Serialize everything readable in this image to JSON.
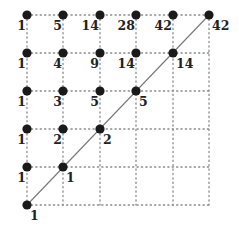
{
  "diagram": {
    "grid_size": 5,
    "colors": {
      "dot": "#1a1a1a",
      "grid": "#8a8a8a",
      "diagonal": "#777777",
      "label": "#222222"
    },
    "columns_px": [
      27,
      63,
      100,
      136,
      173,
      209
    ],
    "rows_px": [
      15,
      53,
      91,
      129,
      167,
      205
    ],
    "points": [
      {
        "col": 0,
        "row": 0,
        "label": "1",
        "side": "left"
      },
      {
        "col": 1,
        "row": 0,
        "label": "5",
        "side": "left"
      },
      {
        "col": 2,
        "row": 0,
        "label": "14",
        "side": "left"
      },
      {
        "col": 3,
        "row": 0,
        "label": "28",
        "side": "left"
      },
      {
        "col": 4,
        "row": 0,
        "label": "42",
        "side": "left"
      },
      {
        "col": 5,
        "row": 0,
        "label": "42",
        "side": "right"
      },
      {
        "col": 0,
        "row": 1,
        "label": "1",
        "side": "left"
      },
      {
        "col": 1,
        "row": 1,
        "label": "4",
        "side": "left"
      },
      {
        "col": 2,
        "row": 1,
        "label": "9",
        "side": "left"
      },
      {
        "col": 3,
        "row": 1,
        "label": "14",
        "side": "left"
      },
      {
        "col": 4,
        "row": 1,
        "label": "14",
        "side": "right"
      },
      {
        "col": 0,
        "row": 2,
        "label": "1",
        "side": "left"
      },
      {
        "col": 1,
        "row": 2,
        "label": "3",
        "side": "left"
      },
      {
        "col": 2,
        "row": 2,
        "label": "5",
        "side": "left"
      },
      {
        "col": 3,
        "row": 2,
        "label": "5",
        "side": "right"
      },
      {
        "col": 0,
        "row": 3,
        "label": "1",
        "side": "left"
      },
      {
        "col": 1,
        "row": 3,
        "label": "2",
        "side": "left"
      },
      {
        "col": 2,
        "row": 3,
        "label": "2",
        "side": "right"
      },
      {
        "col": 0,
        "row": 4,
        "label": "1",
        "side": "left"
      },
      {
        "col": 1,
        "row": 4,
        "label": "1",
        "side": "right"
      },
      {
        "col": 0,
        "row": 5,
        "label": "1",
        "side": "right"
      }
    ]
  }
}
